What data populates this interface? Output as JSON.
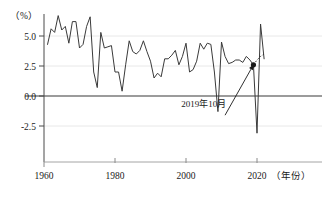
{
  "chart_data": {
    "type": "line",
    "title": "",
    "xlabel": "（年份）",
    "ylabel": "（%）",
    "unit": "（%）",
    "grid": true,
    "legend_position": "none",
    "xlim": [
      1960,
      2023
    ],
    "ylim": [
      -4.2,
      7.2
    ],
    "xticks": [
      1960,
      1980,
      2000,
      2020
    ],
    "xtick_labels": [
      "1960",
      "1980",
      "2000",
      "2020"
    ],
    "yticks": [
      -2.5,
      0.0,
      2.5,
      5.0
    ],
    "ytick_labels": [
      "-2.5",
      "0.0",
      "2.5",
      "5.0"
    ],
    "series": [
      {
        "name": "world-gdp-growth",
        "style": "solid",
        "x": [
          1961,
          1962,
          1963,
          1964,
          1965,
          1966,
          1967,
          1968,
          1969,
          1970,
          1971,
          1972,
          1973,
          1974,
          1975,
          1976,
          1977,
          1978,
          1979,
          1980,
          1981,
          1982,
          1983,
          1984,
          1985,
          1986,
          1987,
          1988,
          1989,
          1990,
          1991,
          1992,
          1993,
          1994,
          1995,
          1996,
          1997,
          1998,
          1999,
          2000,
          2001,
          2002,
          2003,
          2004,
          2005,
          2006,
          2007,
          2008,
          2009,
          2010,
          2011,
          2012,
          2013,
          2014,
          2015,
          2016,
          2017,
          2018,
          2019,
          2020,
          2021,
          2022
        ],
        "values": [
          4.3,
          5.6,
          5.3,
          6.7,
          5.5,
          5.8,
          4.4,
          6.2,
          6.2,
          4.0,
          4.3,
          5.8,
          6.6,
          2.0,
          0.7,
          5.3,
          4.0,
          4.1,
          4.2,
          2.0,
          2.0,
          0.4,
          2.6,
          4.6,
          3.7,
          3.5,
          3.8,
          4.6,
          3.7,
          2.9,
          1.5,
          1.9,
          1.6,
          3.1,
          3.1,
          3.4,
          3.8,
          2.6,
          3.3,
          4.4,
          2.0,
          2.2,
          2.9,
          4.4,
          3.9,
          4.4,
          4.3,
          2.0,
          -1.3,
          4.5,
          3.3,
          2.7,
          2.8,
          3.0,
          3.0,
          2.8,
          3.3,
          3.0,
          2.6,
          -3.1,
          6.0,
          3.1
        ]
      },
      {
        "name": "forecast-dotted",
        "style": "dotted",
        "x": [
          2019,
          2020,
          2021,
          2022
        ],
        "values": [
          2.6,
          3.0,
          3.3,
          3.5
        ]
      }
    ],
    "markers": [
      {
        "name": "highlight-point",
        "x": 2019,
        "y": 2.6
      }
    ],
    "annotations": [
      {
        "name": "october-2019-callout",
        "text": "2019年10月",
        "x": 2005,
        "y": -0.9,
        "arrow_from": [
          2011,
          -1.6
        ],
        "arrow_to": [
          2019,
          2.6
        ]
      }
    ]
  }
}
